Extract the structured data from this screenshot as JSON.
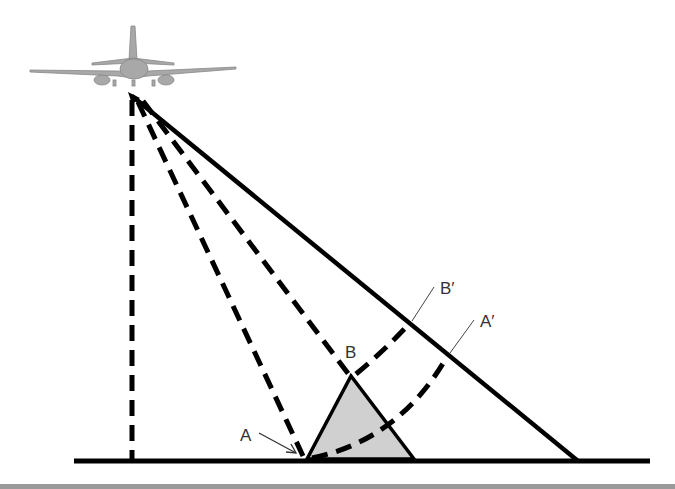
{
  "diagram": {
    "labels": {
      "A": "A",
      "B": "B",
      "A_prime": "A′",
      "B_prime": "B′"
    },
    "icons": [
      "airplane-icon"
    ],
    "colors": {
      "line": "#000000",
      "triangle_fill": "#d0d0d0",
      "label": "#333333",
      "aircraft": "#9a9a9a"
    }
  }
}
